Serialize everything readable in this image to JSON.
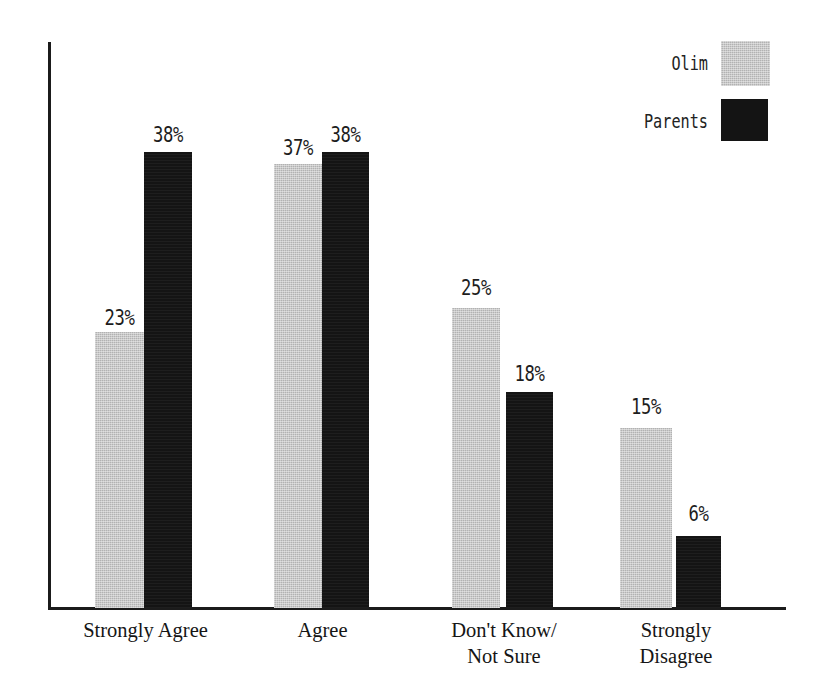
{
  "chart_data": {
    "type": "bar",
    "title": "",
    "subtitle": "",
    "xlabel": "",
    "ylabel": "",
    "ylim": [
      0,
      47
    ],
    "grid": false,
    "legend_position": "top-right",
    "categories": [
      "Strongly Agree",
      "Agree",
      "Don't Know/\nNot Sure",
      "Strongly\nDisagree"
    ],
    "series": [
      {
        "name": "Olim",
        "color": "#b2b2b2",
        "values": [
          23,
          37,
          25,
          15
        ],
        "labels": [
          "23%",
          "37%",
          "25%",
          "15%"
        ]
      },
      {
        "name": "Parents",
        "color": "#141414",
        "values": [
          38,
          38,
          18,
          6
        ],
        "labels": [
          "38%",
          "38%",
          "18%",
          "6%"
        ]
      }
    ]
  },
  "legend": {
    "items": [
      {
        "label": "Olim",
        "color": "#b2b2b2"
      },
      {
        "label": "Parents",
        "color": "#141414"
      }
    ]
  },
  "axes": {
    "y_axis_color": "#1b1b1b",
    "x_axis_color": "#1b1b1b",
    "tick_labels": []
  }
}
